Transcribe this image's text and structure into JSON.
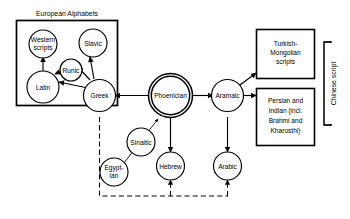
{
  "diagram": {
    "group_label": "European Alphabets",
    "vertical_label": "Chinese script",
    "nodes": {
      "western_scripts": {
        "label_line1": "Western",
        "label_line2": "scripts"
      },
      "slavic": {
        "label": "Slavic"
      },
      "runic": {
        "label": "Runic"
      },
      "latin": {
        "label": "Latin"
      },
      "greek": {
        "label": "Greek"
      },
      "phoenician": {
        "label": "Phoenician"
      },
      "aramaic": {
        "label": "Aramaic"
      },
      "sinaitic": {
        "label": "Sinaitic"
      },
      "egyptian": {
        "label_line1": "Egypt-",
        "label_line2": "ian"
      },
      "hebrew": {
        "label": "Hebrew"
      },
      "arabic": {
        "label": "Arabic"
      },
      "turkish_mongolian": {
        "label_line1": "Turkish-",
        "label_line2": "Mongolian",
        "label_line3": "scripts"
      },
      "persian_indian": {
        "label_line1": "Persian and",
        "label_line2": "Indian (incl.",
        "label_line3": "Brahmi and",
        "label_line4": "Kharosthi)"
      }
    },
    "colors": {
      "stroke": "#000000",
      "fill": "#ffffff",
      "background": "#ffffff"
    }
  }
}
